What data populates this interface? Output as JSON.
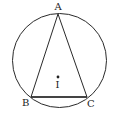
{
  "diagram": {
    "type": "geometry",
    "colors": {
      "stroke": "#2a2a2a",
      "background": "#ffffff"
    },
    "circle": {
      "cx": 59.5,
      "cy": 60.5,
      "r": 47
    },
    "points": {
      "A": {
        "label": "A",
        "x": 58,
        "y": 14
      },
      "B": {
        "label": "B",
        "x": 31,
        "y": 97
      },
      "C": {
        "label": "C",
        "x": 87,
        "y": 97
      },
      "I": {
        "label": "I",
        "x": 58,
        "y": 77
      }
    }
  }
}
